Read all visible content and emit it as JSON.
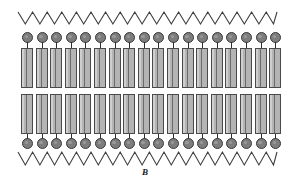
{
  "figure": {
    "caption": "B",
    "caption_y": 167,
    "background_color": "#ffffff",
    "width": 290,
    "height": 185
  },
  "diagram": {
    "type": "lipid-bilayer-schematic",
    "lipid_count_per_leaflet": 18,
    "lipid_start_x": 21,
    "lipid_spacing": 14.6,
    "colors": {
      "head_fill": "#7d7d7d",
      "head_stroke": "#3a3a3a",
      "tail_fill": "#b4b4b4",
      "tail_stroke": "#4a4a4a",
      "stem": "#2f2f2f",
      "zigzag": "#3d3d3d"
    },
    "upper_leaflet": {
      "head_y": 32,
      "head_size": 11,
      "stem_y": 42,
      "stem_height": 6,
      "tail_y": 48,
      "tail_height": 40
    },
    "lower_leaflet": {
      "tail_y": 94,
      "tail_height": 40,
      "stem_y": 134,
      "stem_height": 5,
      "head_y": 138,
      "head_size": 11
    },
    "zigzag_top": {
      "x_start": 18,
      "x_end": 277,
      "y_top": 12,
      "y_bottom": 24,
      "period": 14.6,
      "stroke_width": 1.1
    },
    "zigzag_bottom": {
      "x_start": 18,
      "x_end": 277,
      "y_top": 152,
      "y_bottom": 165,
      "period": 14.6,
      "stroke_width": 1.1
    }
  }
}
